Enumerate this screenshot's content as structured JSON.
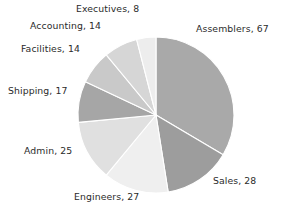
{
  "chart_data": {
    "type": "pie",
    "title": "",
    "categories": [
      "Assemblers",
      "Sales",
      "Engineers",
      "Admin",
      "Shipping",
      "Facilities",
      "Accounting",
      "Executives"
    ],
    "values": [
      67,
      28,
      27,
      25,
      17,
      14,
      14,
      8
    ],
    "total": 200,
    "start_angle_deg": 0,
    "direction": "clockwise",
    "legend": "none",
    "grid": false,
    "labels": [
      {
        "key": "assemblers",
        "text": "Assemblers, 67",
        "name": "Assemblers",
        "value": 67,
        "color": "#a9a9a9"
      },
      {
        "key": "sales",
        "text": "Sales, 28",
        "name": "Sales",
        "value": 28,
        "color": "#9d9d9d"
      },
      {
        "key": "engineers",
        "text": "Engineers, 27",
        "name": "Engineers",
        "value": 27,
        "color": "#efefef"
      },
      {
        "key": "admin",
        "text": "Admin, 25",
        "name": "Admin",
        "value": 25,
        "color": "#e0e0e0"
      },
      {
        "key": "shipping",
        "text": "Shipping, 17",
        "name": "Shipping",
        "value": 17,
        "color": "#a6a6a6"
      },
      {
        "key": "facilities",
        "text": "Facilities, 14",
        "name": "Facilities",
        "value": 14,
        "color": "#c9c9c9"
      },
      {
        "key": "accounting",
        "text": "Accounting, 14",
        "name": "Accounting",
        "value": 14,
        "color": "#d6d6d6"
      },
      {
        "key": "executives",
        "text": "Executives, 8",
        "name": "Executives",
        "value": 8,
        "color": "#ededed"
      }
    ],
    "geometry": {
      "cx": 156,
      "cy": 115,
      "r": 78,
      "separator_color": "#ffffff",
      "separator_width": 1.1
    }
  }
}
